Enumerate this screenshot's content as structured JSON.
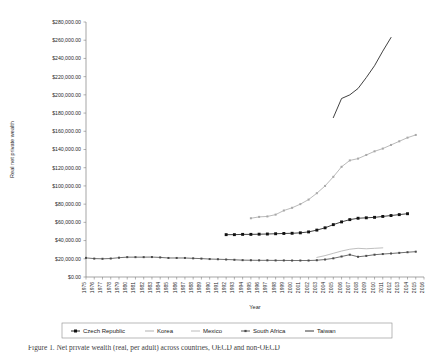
{
  "figure": {
    "caption": "Figure 1. Net private wealth (real, per adult) across countries, OECD and non-OECD"
  },
  "chart_data": {
    "type": "line",
    "title": "",
    "xlabel": "Year",
    "ylabel": "Real net private wealth",
    "ylim": [
      0,
      280000
    ],
    "ytick_step": 20000,
    "ytick_labels": [
      "$0.00",
      "$20,000.00",
      "$40,000.00",
      "$60,000.00",
      "$80,000.00",
      "$100,000.00",
      "$120,000.00",
      "$140,000.00",
      "$160,000.00",
      "$180,000.00",
      "$200,000.00",
      "$220,000.00",
      "$240,000.00",
      "$260,000.00",
      "$280,000.00"
    ],
    "grid": false,
    "legend_position": "bottom",
    "x": [
      1975,
      1976,
      1977,
      1978,
      1979,
      1980,
      1981,
      1982,
      1983,
      1984,
      1985,
      1986,
      1987,
      1988,
      1989,
      1990,
      1991,
      1992,
      1993,
      1994,
      1995,
      1996,
      1997,
      1998,
      1999,
      2000,
      2001,
      2002,
      2003,
      2004,
      2005,
      2006,
      2007,
      2008,
      2009,
      2010,
      2011,
      2012,
      2013,
      2014,
      2015,
      2016
    ],
    "series": [
      {
        "name": "Czech Republic",
        "color": "#111111",
        "marker": "square",
        "x": [
          1992,
          1993,
          1994,
          1995,
          1996,
          1997,
          1998,
          1999,
          2000,
          2001,
          2002,
          2003,
          2004,
          2005,
          2006,
          2007,
          2008,
          2009,
          2010,
          2011,
          2012,
          2013,
          2014
        ],
        "values": [
          46500,
          46500,
          46800,
          46800,
          47000,
          47200,
          47500,
          47800,
          48000,
          48500,
          49500,
          51500,
          54000,
          57500,
          60500,
          63000,
          64500,
          65000,
          65500,
          66500,
          67500,
          68500,
          69500
        ]
      },
      {
        "name": "Korea",
        "color": "#a8a8a8",
        "marker": "diamond-small",
        "x": [
          1995,
          1996,
          1997,
          1998,
          1999,
          2000,
          2001,
          2002,
          2003,
          2004,
          2005,
          2006,
          2007,
          2008,
          2009,
          2010,
          2011,
          2012,
          2013,
          2014,
          2015
        ],
        "values": [
          64500,
          66000,
          66500,
          68500,
          73000,
          76000,
          80000,
          85000,
          92000,
          100000,
          110000,
          121000,
          128000,
          130000,
          134000,
          138000,
          141000,
          145000,
          149000,
          153000,
          156000
        ]
      },
      {
        "name": "Mexico",
        "color": "#b4b4b4",
        "marker": "none",
        "x": [
          2003,
          2004,
          2005,
          2006,
          2007,
          2008,
          2009,
          2010,
          2011
        ],
        "values": [
          21500,
          23500,
          26000,
          28500,
          30500,
          31500,
          31000,
          31500,
          32000
        ]
      },
      {
        "name": "South Africa",
        "color": "#4a4a4a",
        "marker": "square-small",
        "x": [
          1975,
          1976,
          1977,
          1978,
          1979,
          1980,
          1981,
          1982,
          1983,
          1984,
          1985,
          1986,
          1987,
          1988,
          1989,
          1990,
          1991,
          1992,
          1993,
          1994,
          1995,
          1996,
          1997,
          1998,
          1999,
          2000,
          2001,
          2002,
          2003,
          2004,
          2005,
          2006,
          2007,
          2008,
          2009,
          2010,
          2011,
          2012,
          2013,
          2014,
          2015
        ],
        "values": [
          21000,
          20200,
          20000,
          20300,
          21200,
          21800,
          21800,
          21800,
          21900,
          21500,
          20900,
          20900,
          20900,
          20500,
          20200,
          19700,
          19500,
          19200,
          18900,
          18500,
          18400,
          18300,
          18300,
          18200,
          18200,
          18100,
          18100,
          18100,
          18400,
          19200,
          20500,
          22500,
          24500,
          22200,
          23200,
          24500,
          25200,
          25800,
          26500,
          27200,
          27800
        ]
      },
      {
        "name": "Taiwan",
        "color": "#1f1f1f",
        "marker": "none",
        "x": [
          2005,
          2006,
          2007,
          2008,
          2009,
          2010,
          2011,
          2012
        ],
        "values": [
          175000,
          196000,
          200000,
          207000,
          219000,
          232000,
          248000,
          263000
        ]
      }
    ]
  },
  "legend": {
    "items": [
      {
        "label": "Czech Republic",
        "marker": "square",
        "color": "#111111"
      },
      {
        "label": "Korea",
        "marker": "line",
        "color": "#a8a8a8"
      },
      {
        "label": "Mexico",
        "marker": "line",
        "color": "#b4b4b4"
      },
      {
        "label": "South Africa",
        "marker": "square-small",
        "color": "#4a4a4a"
      },
      {
        "label": "Taiwan",
        "marker": "line",
        "color": "#1f1f1f"
      }
    ]
  }
}
